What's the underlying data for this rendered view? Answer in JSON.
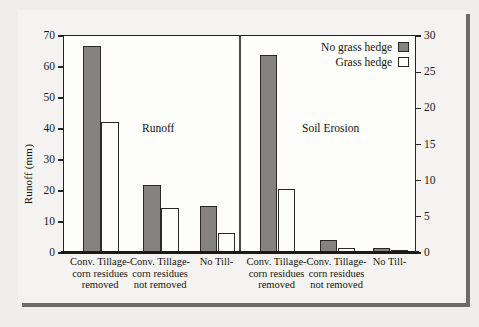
{
  "chart_data": {
    "type": "bar",
    "title": "",
    "panels": [
      {
        "name": "Runoff",
        "caption": "Runoff",
        "axis": "left"
      },
      {
        "name": "Soil Erosion",
        "caption": "Soil Erosion",
        "axis": "right"
      }
    ],
    "categories": [
      "Conv. Tillage-corn residues removed",
      "Conv. Tillage-corn residues not removed",
      "No Till-",
      "Conv. Tillage-corn residues removed",
      "Conv. Tillage-corn residues not removed",
      "No Till-"
    ],
    "category_lines": [
      [
        "Conv. Tillage-",
        "corn residues",
        "removed"
      ],
      [
        "Conv. Tillage-",
        "corn residues",
        "not removed"
      ],
      [
        "No Till-"
      ],
      [
        "Conv. Tillage-",
        "corn residues",
        "removed"
      ],
      [
        "Conv. Tillage-",
        "corn residues",
        "not removed"
      ],
      [
        "No Till-"
      ]
    ],
    "series": [
      {
        "name": "No grass hedge",
        "color": "#848382",
        "values": [
          66.5,
          21.5,
          15.0,
          27.2,
          1.6,
          0.5
        ]
      },
      {
        "name": "Grass hedge",
        "color": "#fdfdfc",
        "values": [
          42.0,
          14.3,
          6.0,
          8.7,
          0.6,
          0.15
        ]
      }
    ],
    "value_units": [
      "mm",
      "mm",
      "mm",
      "mg/ha",
      "mg/ha",
      "mg/ha"
    ],
    "left_axis": {
      "label": "Runoff (mm)",
      "min": 0,
      "max": 70,
      "step": 10,
      "ticks": [
        "0",
        "10",
        "20",
        "30",
        "40",
        "50",
        "60",
        "70"
      ]
    },
    "right_axis": {
      "label": "Soil Erosion (mg/ha)",
      "min": 0,
      "max": 30,
      "step": 5,
      "ticks": [
        "0",
        "5",
        "10",
        "15",
        "20",
        "25",
        "30"
      ]
    },
    "xlabel": "",
    "grid": false,
    "legend_position": "top-right",
    "legend": [
      {
        "label": "No grass hedge",
        "swatch": "gray"
      },
      {
        "label": "Grass hedge",
        "swatch": "white"
      }
    ]
  }
}
